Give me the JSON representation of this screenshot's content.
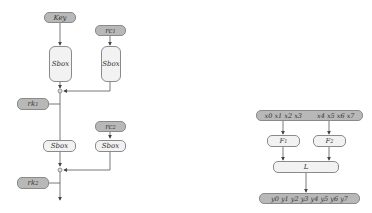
{
  "left_diagram": {
    "key": "Key",
    "rc1": "rc1",
    "rc2": "rc2",
    "sbox": "Sbox",
    "rk1": "rk1",
    "rk2": "rk2"
  },
  "right_diagram": {
    "input_left": "x0 x1 x2 x3",
    "input_right": "x4 x5 x6 x7",
    "f1": "F1",
    "f2": "F2",
    "l": "L",
    "output": "y0 y1 y2 y3 y4 y5 y6 y7"
  },
  "colors": {
    "dark_node": "#b8b8b8",
    "light_node": "#f2f2f2",
    "line": "#555555"
  }
}
